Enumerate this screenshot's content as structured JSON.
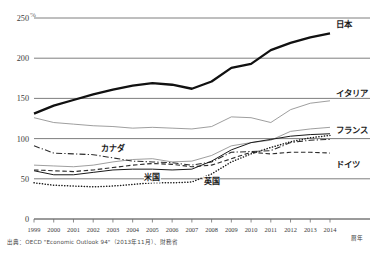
{
  "chart_data": {
    "type": "line",
    "title": "",
    "xlabel": "暦年",
    "ylabel": "",
    "unit_label": "%",
    "grid": true,
    "legend_position": "inline-right",
    "xlim": [
      1999,
      2014
    ],
    "ylim": [
      0,
      250
    ],
    "yticks": [
      0,
      50,
      100,
      150,
      200,
      250
    ],
    "x": [
      1999,
      2000,
      2001,
      2002,
      2003,
      2004,
      2005,
      2006,
      2007,
      2008,
      2009,
      2010,
      2011,
      2012,
      2013,
      2014
    ],
    "categories": [
      "1999",
      "2000",
      "2001",
      "2002",
      "2003",
      "2004",
      "2005",
      "2006",
      "2007",
      "2008",
      "2009",
      "2010",
      "2011",
      "2012",
      "2013",
      "2014"
    ],
    "series": [
      {
        "name": "日本",
        "style": "solid-thick",
        "color": "#111111",
        "label_x": 2014,
        "values": [
          131,
          141,
          148,
          155,
          161,
          166,
          169,
          167,
          162,
          171,
          188,
          193,
          210,
          219,
          226,
          231
        ]
      },
      {
        "name": "イタリア",
        "style": "solid-thin",
        "color": "#8c8c8c",
        "label_x": 2014,
        "values": [
          126,
          120,
          118,
          116,
          115,
          113,
          114,
          113,
          112,
          115,
          127,
          126,
          120,
          136,
          144,
          147
        ]
      },
      {
        "name": "フランス",
        "style": "solid-thin",
        "color": "#8c8c8c",
        "label_x": 2014,
        "values": [
          67,
          66,
          65,
          67,
          71,
          74,
          75,
          71,
          72,
          79,
          91,
          95,
          98,
          109,
          112,
          114
        ]
      },
      {
        "name": "カナダ",
        "style": "dash-dot",
        "color": "#2b2b2b",
        "label_x": 2003,
        "values": [
          91,
          82,
          81,
          80,
          76,
          72,
          71,
          70,
          67,
          71,
          83,
          84,
          85,
          95,
          98,
          99
        ]
      },
      {
        "name": "ドイツ",
        "style": "dashed",
        "color": "#2b2b2b",
        "label_x": 2014,
        "values": [
          61,
          60,
          59,
          61,
          64,
          67,
          69,
          68,
          65,
          67,
          75,
          83,
          81,
          83,
          83,
          82
        ]
      },
      {
        "name": "米国",
        "style": "solid-thin-dark",
        "color": "#1a1a1a",
        "label_x": 2005,
        "values": [
          60,
          55,
          55,
          58,
          61,
          62,
          62,
          61,
          62,
          72,
          86,
          95,
          99,
          103,
          105,
          106
        ]
      },
      {
        "name": "英国",
        "style": "dotted",
        "color": "#1a1a1a",
        "label_x": 2008,
        "values": [
          45,
          42,
          41,
          40,
          41,
          43,
          45,
          45,
          46,
          56,
          71,
          81,
          89,
          96,
          101,
          104
        ]
      }
    ]
  },
  "axis": {
    "yticks": [
      "0",
      "50",
      "100",
      "150",
      "200",
      "250"
    ],
    "unit": "%",
    "xticks": [
      "1999",
      "2000",
      "2001",
      "2002",
      "2003",
      "2004",
      "2005",
      "2006",
      "2007",
      "2008",
      "2009",
      "2010",
      "2011",
      "2012",
      "2013",
      "2014"
    ],
    "x_unit": "暦年"
  },
  "labels": {
    "japan": "日本",
    "italy": "イタリア",
    "france": "フランス",
    "canada": "カナダ",
    "germany": "ドイツ",
    "usa": "米国",
    "uk": "英国"
  },
  "source": {
    "text": "出典：OECD \"Economic Outlook 94\"（2013年11月）、財務省"
  },
  "colors": {
    "japan": "#111111",
    "italy": "#8c8c8c",
    "france": "#8c8c8c",
    "canada": "#2b2b2b",
    "germany": "#2b2b2b",
    "usa": "#1a1a1a",
    "uk": "#1a1a1a",
    "grid": "#6f6f6f",
    "text": "#231f20"
  }
}
